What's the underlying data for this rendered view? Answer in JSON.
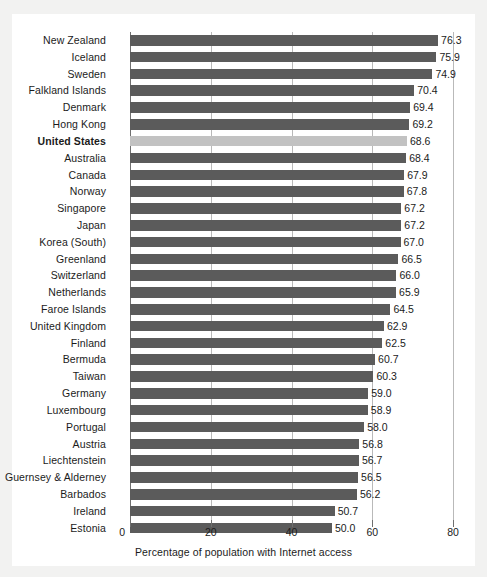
{
  "chart_data": {
    "type": "bar",
    "orientation": "horizontal",
    "title": "",
    "xlabel": "Percentage of population with Internet access",
    "ylabel": "",
    "xlim": [
      0,
      80
    ],
    "xticks": [
      0,
      20,
      40,
      60,
      80
    ],
    "xtick_labels": [
      "0",
      "20",
      "40",
      "60",
      "80"
    ],
    "grid": true,
    "grid_axis": "x",
    "legend": false,
    "value_label_format": "one-decimal",
    "categories": [
      "New Zealand",
      "Iceland",
      "Sweden",
      "Falkland Islands",
      "Denmark",
      "Hong Kong",
      "United States",
      "Australia",
      "Canada",
      "Norway",
      "Singapore",
      "Japan",
      "Korea (South)",
      "Greenland",
      "Switzerland",
      "Netherlands",
      "Faroe Islands",
      "United Kingdom",
      "Finland",
      "Bermuda",
      "Taiwan",
      "Germany",
      "Luxembourg",
      "Portugal",
      "Austria",
      "Liechtenstein",
      "Guernsey & Alderney",
      "Barbados",
      "Ireland",
      "Estonia"
    ],
    "values": [
      76.3,
      75.9,
      74.9,
      70.4,
      69.4,
      69.2,
      68.6,
      68.4,
      67.9,
      67.8,
      67.2,
      67.2,
      67.0,
      66.5,
      66.0,
      65.9,
      64.5,
      62.9,
      62.5,
      60.7,
      60.3,
      59.0,
      58.9,
      58.0,
      56.8,
      56.7,
      56.5,
      56.2,
      50.7,
      50.0
    ],
    "value_labels": [
      "76.3",
      "75.9",
      "74.9",
      "70.4",
      "69.4",
      "69.2",
      "68.6",
      "68.4",
      "67.9",
      "67.8",
      "67.2",
      "67.2",
      "67.0",
      "66.5",
      "66.0",
      "65.9",
      "64.5",
      "62.9",
      "62.5",
      "60.7",
      "60.3",
      "59.0",
      "58.9",
      "58.0",
      "56.8",
      "56.7",
      "56.5",
      "56.2",
      "50.7",
      "50.0"
    ],
    "highlighted_category": "United States",
    "highlighted_index": 6,
    "colors": {
      "bar": "#5b5b5b",
      "bar_highlighted": "#c2c2c2",
      "gridline": "#b9b9b9",
      "axis": "#6f6f6f",
      "text": "#1b1b1b",
      "plot_background": "#ffffff",
      "page_background": "#f2f2f1"
    }
  }
}
